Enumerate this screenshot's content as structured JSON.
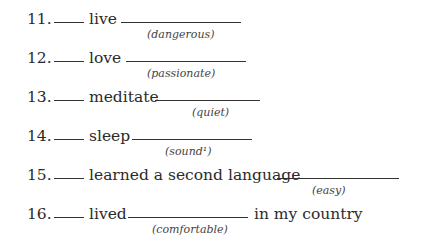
{
  "exercise": {
    "items": [
      {
        "number": "11.",
        "verb": "live",
        "hint": "(dangerous)",
        "tail": ""
      },
      {
        "number": "12.",
        "verb": "love",
        "hint": "(passionate)",
        "tail": ""
      },
      {
        "number": "13.",
        "verb": "meditate",
        "hint": "(quiet)",
        "tail": ""
      },
      {
        "number": "14.",
        "verb": "sleep",
        "hint": "(sound¹)",
        "tail": ""
      },
      {
        "number": "15.",
        "verb": "learned a second language",
        "hint": "(easy)",
        "tail": ""
      },
      {
        "number": "16.",
        "verb": "lived",
        "hint": "(comfortable)",
        "tail": "in my country"
      }
    ]
  }
}
